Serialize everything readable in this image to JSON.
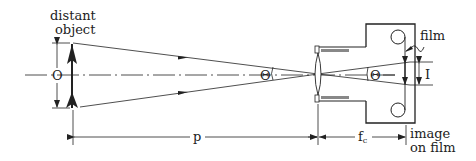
{
  "diagram": {
    "labels": {
      "object_label_line1": "distant",
      "object_label_line2": "object",
      "object_size": "O",
      "angle_object": "Θ",
      "angle_image": "Θ",
      "image_size": "I",
      "film": "film",
      "distance_p": "p",
      "focal_length": "f",
      "focal_length_sub": "c",
      "image_on_film_line1": "image",
      "image_on_film_line2": "on film"
    },
    "colors": {
      "line": "#222222",
      "background": "#ffffff",
      "gray_fill": "#888888"
    }
  }
}
